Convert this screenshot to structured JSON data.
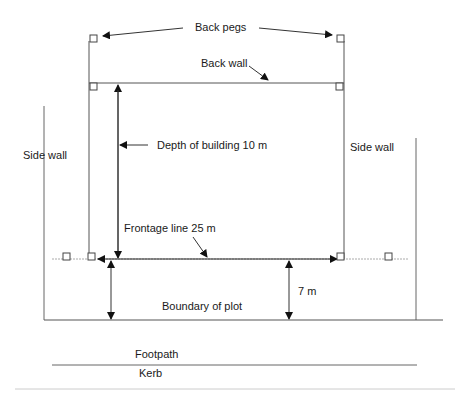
{
  "diagram": {
    "labels": {
      "back_pegs": "Back pegs",
      "back_wall": "Back wall",
      "depth": "Depth of building 10 m",
      "side_wall_left": "Side wall",
      "side_wall_right": "Side wall",
      "frontage": "Frontage line 25 m",
      "setback": "7 m",
      "boundary": "Boundary of plot",
      "footpath": "Footpath",
      "kerb": "Kerb"
    },
    "dimensions": {
      "building_depth_m": 10,
      "frontage_length_m": 25,
      "setback_from_boundary_m": 7
    },
    "colors": {
      "line": "#3a3a3a",
      "line_light": "#8a8a8a",
      "dotted": "#a0a0a0",
      "text": "#1a1a1a",
      "peg_fill": "#ffffff"
    }
  }
}
